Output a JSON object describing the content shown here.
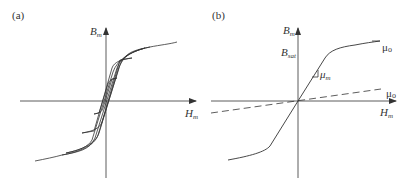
{
  "panels": [
    {
      "id": "a",
      "label": "(a)",
      "y_axis": {
        "symbol": "B",
        "subscript": "m"
      },
      "x_axis": {
        "symbol": "H",
        "subscript": "m"
      },
      "description": "Nested hysteresis loops (B–H) of magnetic material"
    },
    {
      "id": "b",
      "label": "(b)",
      "y_axis": {
        "symbol": "B",
        "subscript": "m"
      },
      "x_axis": {
        "symbol": "H",
        "subscript": "m"
      },
      "saturation_label": {
        "symbol": "B",
        "subscript": "sat"
      },
      "slope_label_linear": {
        "symbol": "μ",
        "subscript": "m"
      },
      "slope_label_saturated": {
        "symbol": "μ",
        "subscript": "o"
      },
      "slope_label_vacuum": {
        "symbol": "μ",
        "subscript": "o"
      },
      "description": "Piecewise-linear B–H approximation with saturation; dashed line shows vacuum permeability μo"
    }
  ],
  "colors": {
    "line": "#333333",
    "text": "#333333",
    "background": "#ffffff"
  }
}
